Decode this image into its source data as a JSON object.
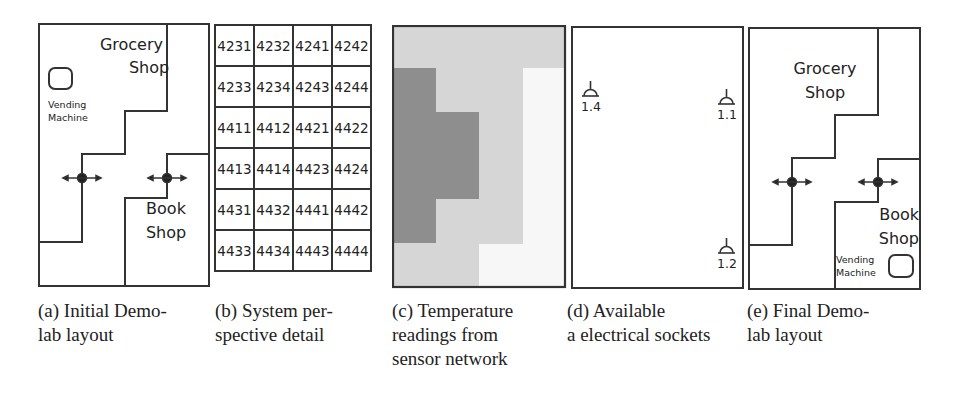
{
  "figure": {
    "panels": [
      {
        "id": "a",
        "labels": {
          "grocery_line1": "Grocery",
          "grocery_line2": "Shop",
          "vending_line1": "Vending",
          "vending_line2": "Machine",
          "book_line1": "Book",
          "book_line2": "Shop"
        },
        "caption": {
          "line1_parts": [
            "(a)",
            "Initial",
            "Demo-"
          ],
          "line2": "lab layout"
        }
      },
      {
        "id": "b",
        "grid": [
          [
            "4231",
            "4232",
            "4241",
            "4242"
          ],
          [
            "4233",
            "4234",
            "4243",
            "4244"
          ],
          [
            "4411",
            "4412",
            "4421",
            "4422"
          ],
          [
            "4413",
            "4414",
            "4423",
            "4424"
          ],
          [
            "4431",
            "4432",
            "4441",
            "4442"
          ],
          [
            "4433",
            "4434",
            "4443",
            "4444"
          ]
        ],
        "caption": {
          "line1_parts": [
            "(b)",
            "System",
            "per-"
          ],
          "line2": "spective detail"
        }
      },
      {
        "id": "c",
        "colors": {
          "light": "#d6d6d6",
          "dark": "#8e8e8e",
          "white": "#f7f7f7"
        },
        "caption": {
          "line1_parts": [
            "(c)",
            "Temperature"
          ],
          "line2_parts": [
            "readings",
            "from"
          ],
          "line3": "sensor network"
        }
      },
      {
        "id": "d",
        "sockets": [
          {
            "label": "1.4"
          },
          {
            "label": "1.1"
          },
          {
            "label": "1.2"
          }
        ],
        "caption": {
          "line1_parts": [
            "(d)",
            "Available"
          ],
          "line2": "a electrical sockets"
        }
      },
      {
        "id": "e",
        "labels": {
          "grocery_line1": "Grocery",
          "grocery_line2": "Shop",
          "book_line1": "Book",
          "book_line2": "Shop",
          "vending_line1": "Vending",
          "vending_line2": "Machine"
        },
        "caption": {
          "line1_parts": [
            "(e)",
            "Final",
            "Demo-"
          ],
          "line2": "lab layout"
        }
      }
    ]
  }
}
